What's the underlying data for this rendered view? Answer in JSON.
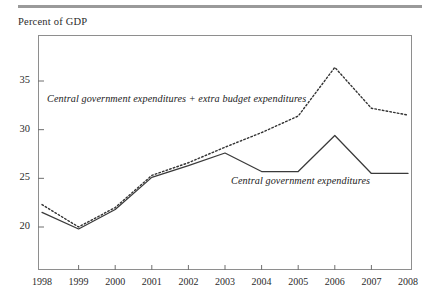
{
  "figure": {
    "axis_caption": "Percent of GDP",
    "top_rule_color": "#9a9a9a",
    "frame_color": "#8e8e8e"
  },
  "chart_data": {
    "type": "line",
    "title": "",
    "subtitle": "",
    "xlabel": "",
    "ylabel": "Percent of GDP",
    "x": [
      1998,
      1999,
      2000,
      2001,
      2002,
      2003,
      2004,
      2005,
      2006,
      2007,
      2008
    ],
    "categories": [
      "1998",
      "1999",
      "2000",
      "2001",
      "2002",
      "2003",
      "2004",
      "2005",
      "2006",
      "2007",
      "2008"
    ],
    "xtick_labels": [
      "1998",
      "1999",
      "2000",
      "2001",
      "2002",
      "2003",
      "2004",
      "2005",
      "2006",
      "2007",
      "2008"
    ],
    "ytick_labels": [
      "20",
      "25",
      "30",
      "35"
    ],
    "yticks": [
      20,
      25,
      30,
      35
    ],
    "ylim": [
      16.5,
      40.5
    ],
    "xlim": [
      1998,
      2008
    ],
    "grid": false,
    "legend_position": "inline-annotations",
    "series": [
      {
        "name": "Central government expenditures + extra budget expenditures",
        "style": "dotted",
        "color": "#333333",
        "values": [
          22.3,
          20.0,
          22.0,
          25.3,
          26.6,
          28.2,
          29.7,
          31.4,
          36.4,
          32.2,
          31.5
        ]
      },
      {
        "name": "Central government expenditures",
        "style": "solid",
        "color": "#333333",
        "values": [
          21.5,
          19.8,
          21.8,
          25.1,
          26.3,
          27.6,
          25.7,
          25.7,
          29.4,
          25.5,
          25.5
        ]
      }
    ],
    "annotations": [
      {
        "text": "Central government expenditures + extra budget expenditures",
        "series": 0
      },
      {
        "text": "Central government expenditures",
        "series": 1
      }
    ]
  }
}
